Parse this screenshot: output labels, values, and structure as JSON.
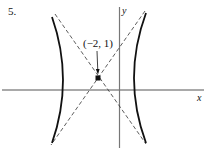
{
  "problem": {
    "number_label": "5."
  },
  "graph": {
    "x_axis_label": "x",
    "y_axis_label": "y",
    "center_point_label": "(−2, 1)",
    "center_point": {
      "x": -2,
      "y": 1
    },
    "curve_type": "hyperbola",
    "branches": [
      "left",
      "right"
    ],
    "asymptotes": "dashed lines through center",
    "colors": {
      "curve": "#111111",
      "axis": "#555555",
      "asymptote": "#333333"
    }
  }
}
